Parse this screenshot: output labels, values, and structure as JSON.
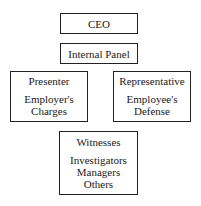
{
  "diagram": {
    "ceo": {
      "label": "CEO"
    },
    "panel": {
      "label": "Internal Panel"
    },
    "presenter": {
      "title": "Presenter",
      "lines": [
        "Employer's",
        "Charges"
      ]
    },
    "representative": {
      "title": "Representative",
      "lines": [
        "Employee's",
        "Defense"
      ]
    },
    "witnesses": {
      "title": "Witnesses",
      "lines": [
        "Investigators",
        "Managers",
        "Others"
      ]
    }
  }
}
